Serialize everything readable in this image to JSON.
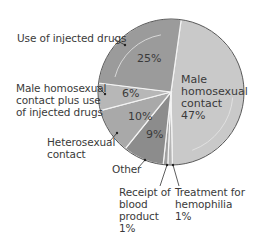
{
  "chart_data": {
    "type": "pie",
    "title": "",
    "slices": [
      {
        "label": "Male homosexual contact",
        "value": 47,
        "display": "47%",
        "color": "#c9c9c9"
      },
      {
        "label": "Treatment for hemophilia",
        "value": 1,
        "display": "1%",
        "color": "#b5b5b5"
      },
      {
        "label": "Receipt of blood product",
        "value": 1,
        "display": "1%",
        "color": "#a0a0a0"
      },
      {
        "label": "Other",
        "value": 9,
        "display": "9%",
        "color": "#8c8c8c"
      },
      {
        "label": "Heterosexual contact",
        "value": 10,
        "display": "10%",
        "color": "#a9a9a9"
      },
      {
        "label": "Male homosexual contact plus use of injected drugs",
        "value": 6,
        "display": "6%",
        "color": "#b7b7b7"
      },
      {
        "label": "Use of injected drugs",
        "value": 25,
        "display": "25%",
        "color": "#9b9b9b"
      }
    ],
    "legend": "none (callout labels)"
  },
  "labels": {
    "injected_drugs": "Use of injected drugs",
    "male_plus_drugs": "Male homosexual\ncontact plus use\nof injected drugs",
    "heterosexual": "Heterosexual\ncontact",
    "other": "Other",
    "blood": "Receipt of\nblood\nproduct\n1%",
    "hemophilia": "Treatment for\nhemophilia\n1%",
    "male": "Male\nhomosexual\ncontact\n47%",
    "pct_25": "25%",
    "pct_6": "6%",
    "pct_10": "10%",
    "pct_9": "9%"
  }
}
